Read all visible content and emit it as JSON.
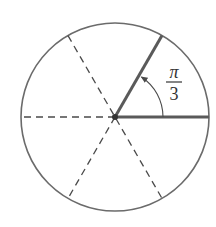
{
  "diagram": {
    "type": "unit-circle-angle",
    "center": {
      "x": 115,
      "y": 117
    },
    "radius": 94,
    "angle_label": {
      "numerator": "π",
      "denominator": "3"
    },
    "angle_degrees": 60,
    "solid_rays_degrees": [
      0,
      60
    ],
    "dashed_diameters_degrees": [
      0,
      120,
      240
    ],
    "colors": {
      "circle": "#6b6b6b",
      "solid_ray": "#5a5a5a",
      "dashed": "#4a4a4a",
      "arc": "#4a4a4a",
      "text": "#333333"
    }
  }
}
